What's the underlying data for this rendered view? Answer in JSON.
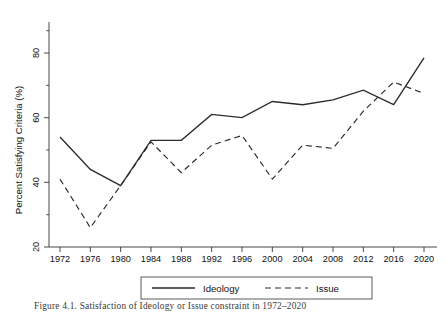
{
  "figure": {
    "caption": "Figure 4.1.  Satisfaction of Ideology or Issue constraint in 1972–2020"
  },
  "chart_data": {
    "type": "line",
    "title": "",
    "xlabel": "",
    "ylabel": "Percent Satisfying Criteria (%)",
    "categories": [
      "1972",
      "1976",
      "1980",
      "1984",
      "1988",
      "1992",
      "1996",
      "2000",
      "2004",
      "2008",
      "2012",
      "2016",
      "2020"
    ],
    "x": [
      1972,
      1976,
      1980,
      1984,
      1988,
      1992,
      1996,
      2000,
      2004,
      2008,
      2012,
      2016,
      2020
    ],
    "xlim": [
      1970,
      2022
    ],
    "ylim": [
      18,
      86
    ],
    "yticks": [
      20,
      40,
      60,
      80
    ],
    "ytick_labels": [
      "20",
      "40",
      "60",
      "80"
    ],
    "yticks_minor": [
      30,
      50,
      70
    ],
    "grid": false,
    "legend_position": "bottom",
    "series": [
      {
        "name": "Ideology",
        "style": "solid",
        "values": [
          54,
          44,
          39,
          53,
          53,
          61,
          60,
          65,
          64,
          65.5,
          68.5,
          64,
          78.5
        ]
      },
      {
        "name": "Issue",
        "style": "dashed",
        "values": [
          41,
          26,
          39,
          52.5,
          43,
          51.5,
          54.5,
          41,
          51.5,
          50.5,
          62,
          71,
          67.5
        ]
      }
    ]
  }
}
